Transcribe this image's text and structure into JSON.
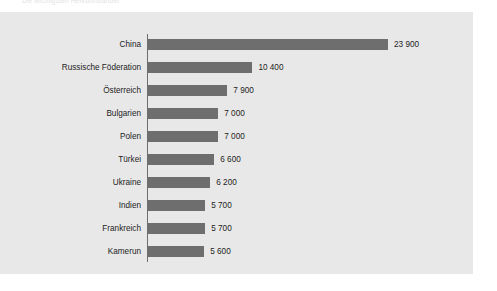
{
  "top_caption": "Die wichtigsten Herkunftslander",
  "chart_data": {
    "type": "bar",
    "orientation": "horizontal",
    "title": "",
    "subtitle": "",
    "xlabel": "",
    "ylabel": "",
    "xlim": [
      0,
      26000
    ],
    "grid": false,
    "legend": null,
    "bar_color": "#6e6e6e",
    "panel_color": "#e8e8e8",
    "axis_color": "#6e6e6e",
    "text_color": "#1c1c1c",
    "categories": [
      "China",
      "Russische Föderation",
      "Österreich",
      "Bulgarien",
      "Polen",
      "Türkei",
      "Ukraine",
      "Indien",
      "Frankreich",
      "Kamerun"
    ],
    "values": [
      23900,
      10400,
      7900,
      7000,
      7000,
      6600,
      6200,
      5700,
      5700,
      5600
    ],
    "value_labels": [
      "23 900",
      "10 400",
      "7 900",
      "7 000",
      "7 000",
      "6 600",
      "6 200",
      "5 700",
      "5 700",
      "5 600"
    ]
  }
}
